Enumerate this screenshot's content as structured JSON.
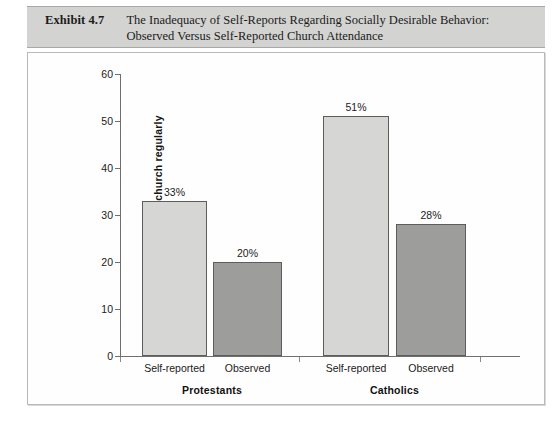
{
  "exhibit": {
    "label": "Exhibit 4.7",
    "title_line1": "The Inadequacy of Self-Reports Regarding Socially Desirable Behavior:",
    "title_line2": "Observed Versus Self-Reported Church Attendance"
  },
  "colors": {
    "header_band": "#d3d3d1",
    "bar_light": "#d6d6d4",
    "bar_dark": "#9d9d9b",
    "bar_outline": "#5d5d5b",
    "axis": "#6f6f6d",
    "plot_background": "#fefefe"
  },
  "chart_data": {
    "type": "bar",
    "title": "The Inadequacy of Self-Reports Regarding Socially Desirable Behavior: Observed Versus Self-Reported Church Attendance",
    "xlabel": "",
    "ylabel": "Percentage attending church regularly",
    "ylim": [
      0,
      60
    ],
    "yticks": [
      0,
      10,
      20,
      30,
      40,
      50,
      60
    ],
    "ytick_labels": [
      "0",
      "10",
      "20",
      "30",
      "40",
      "50",
      "60"
    ],
    "grid": false,
    "legend": "none",
    "groups": [
      "Protestants",
      "Catholics"
    ],
    "categories": [
      "Self-reported",
      "Observed"
    ],
    "bars": [
      {
        "group": "Protestants",
        "category": "Self-reported",
        "value": 33,
        "data_label": "33%",
        "fill": "light"
      },
      {
        "group": "Protestants",
        "category": "Observed",
        "value": 20,
        "data_label": "20%",
        "fill": "dark"
      },
      {
        "group": "Catholics",
        "category": "Self-reported",
        "value": 51,
        "data_label": "51%",
        "fill": "light"
      },
      {
        "group": "Catholics",
        "category": "Observed",
        "value": 28,
        "data_label": "28%",
        "fill": "dark"
      }
    ],
    "series": [
      {
        "name": "Self-reported",
        "values": [
          33,
          51
        ]
      },
      {
        "name": "Observed",
        "values": [
          20,
          28
        ]
      }
    ]
  }
}
